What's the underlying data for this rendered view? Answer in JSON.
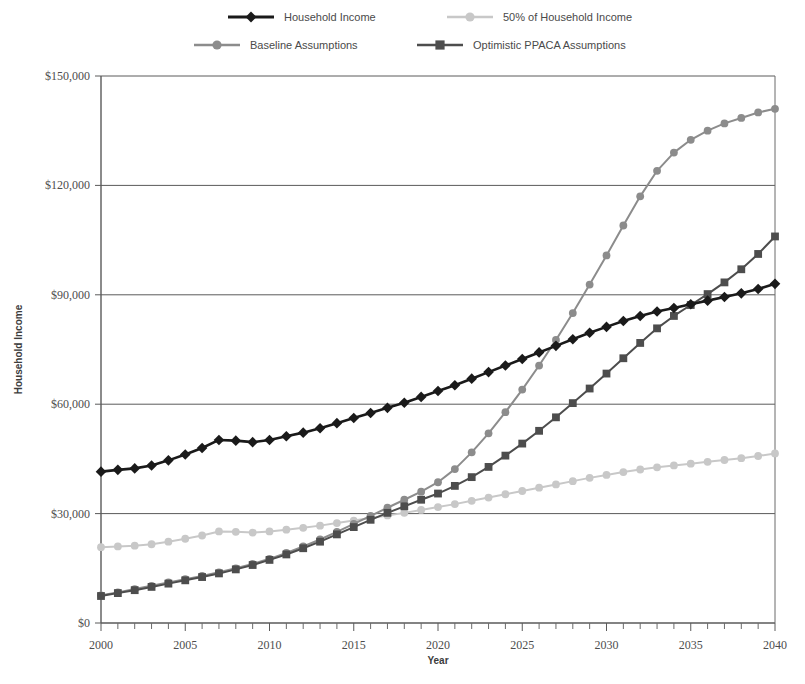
{
  "chart_data": {
    "type": "line",
    "title": "",
    "xlabel": "Year",
    "ylabel": "Household Income",
    "xlim": [
      2000,
      2040
    ],
    "ylim": [
      0,
      150000
    ],
    "grid": true,
    "legend_position": "top",
    "x_ticks": [
      "2000",
      "2005",
      "2010",
      "2015",
      "2020",
      "2025",
      "2030",
      "2035",
      "2040"
    ],
    "x_tick_values": [
      2000,
      2005,
      2010,
      2015,
      2020,
      2025,
      2030,
      2035,
      2040
    ],
    "y_ticks": [
      "$0",
      "$30,000",
      "$60,000",
      "$90,000",
      "$120,000",
      "$150,000"
    ],
    "y_tick_values": [
      0,
      30000,
      60000,
      90000,
      120000,
      150000
    ],
    "x": [
      2000,
      2001,
      2002,
      2003,
      2004,
      2005,
      2006,
      2007,
      2008,
      2009,
      2010,
      2011,
      2012,
      2013,
      2014,
      2015,
      2016,
      2017,
      2018,
      2019,
      2020,
      2021,
      2022,
      2023,
      2024,
      2025,
      2026,
      2027,
      2028,
      2029,
      2030,
      2031,
      2032,
      2033,
      2034,
      2035,
      2036,
      2037,
      2038,
      2039,
      2040
    ],
    "series": [
      {
        "name": "Household Income",
        "color": "#1a1a1a",
        "marker": "diamond",
        "values": [
          41500,
          42000,
          42400,
          43200,
          44600,
          46200,
          48000,
          50200,
          50000,
          49600,
          50200,
          51200,
          52200,
          53400,
          54800,
          56200,
          57600,
          59000,
          60400,
          62000,
          63600,
          65200,
          67000,
          68800,
          70600,
          72400,
          74200,
          76000,
          77800,
          79600,
          81200,
          82800,
          84200,
          85400,
          86400,
          87400,
          88400,
          89400,
          90400,
          91600,
          93000
        ]
      },
      {
        "name": "50% of Household Income",
        "color": "#c8c8c8",
        "marker": "circle",
        "values": [
          20800,
          21000,
          21200,
          21600,
          22300,
          23100,
          24000,
          25100,
          25000,
          24800,
          25100,
          25600,
          26100,
          26700,
          27400,
          28100,
          28800,
          29500,
          30200,
          31000,
          31800,
          32600,
          33500,
          34400,
          35300,
          36200,
          37100,
          38000,
          38900,
          39800,
          40600,
          41400,
          42100,
          42700,
          43200,
          43700,
          44200,
          44700,
          45200,
          45800,
          46500
        ]
      },
      {
        "name": "Baseline Assumptions",
        "color": "#8c8c8c",
        "marker": "circle",
        "values": [
          7600,
          8400,
          9300,
          10200,
          11100,
          12000,
          12900,
          13900,
          15000,
          16200,
          17600,
          19200,
          21000,
          22900,
          25000,
          27200,
          29400,
          31600,
          33800,
          36000,
          38600,
          42200,
          46800,
          52000,
          57800,
          64000,
          70600,
          77600,
          85000,
          92800,
          100800,
          109000,
          117000,
          124000,
          129000,
          132500,
          135000,
          137000,
          138500,
          140000,
          141000
        ]
      },
      {
        "name": "Optimistic PPACA Assumptions",
        "color": "#4d4d4d",
        "marker": "square",
        "values": [
          7400,
          8200,
          9000,
          9900,
          10800,
          11700,
          12600,
          13600,
          14700,
          15900,
          17300,
          18800,
          20500,
          22300,
          24300,
          26300,
          28300,
          30200,
          32000,
          33800,
          35500,
          37600,
          40000,
          42800,
          45900,
          49200,
          52700,
          56400,
          60300,
          64300,
          68400,
          72600,
          76800,
          80800,
          84200,
          87200,
          90200,
          93400,
          97000,
          101200,
          106000
        ]
      }
    ]
  },
  "legend": {
    "items": [
      {
        "label": "Household Income",
        "color": "#1a1a1a",
        "marker": "diamond"
      },
      {
        "label": "50% of Household Income",
        "color": "#c8c8c8",
        "marker": "circle"
      },
      {
        "label": "Baseline Assumptions",
        "color": "#8c8c8c",
        "marker": "circle"
      },
      {
        "label": "Optimistic PPACA Assumptions",
        "color": "#4d4d4d",
        "marker": "square"
      }
    ]
  },
  "axes": {
    "x_title": "Year",
    "y_title": "Household Income"
  }
}
